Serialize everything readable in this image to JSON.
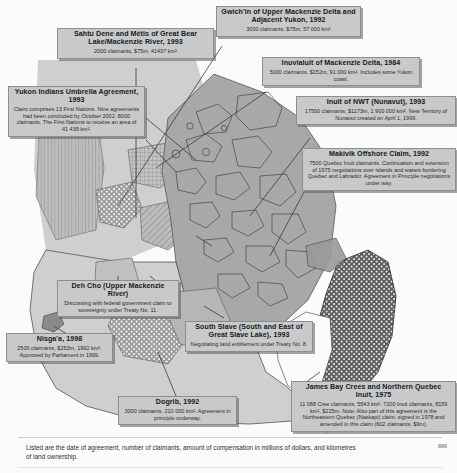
{
  "footnote": "Listed are the date of agreement, number of claimants, amount of compensation in millions of dollars, and kilometres of land ownership.",
  "colors": {
    "land_light": "#cfcfcf",
    "land_mid": "#a8a8a8",
    "land_dark": "#8e8e8e",
    "box_fill": "#c9c9c9",
    "box_border": "#8e8e8e",
    "outline": "#3a3a3a",
    "sea": "#f4f4f4"
  },
  "claims": [
    {
      "id": "sahtu",
      "title": "Sahtu Dene and Métis of Great Bear Lake/Mackenzie River, 1993",
      "detail": "2000 claimants, $75m, 41437 km²"
    },
    {
      "id": "gwichin",
      "title": "Gwich'in of Upper Mackenzie Delta and Adjacent Yukon, 1992",
      "detail": "3000 claimants, $75m, 57 000 km²"
    },
    {
      "id": "inuvialuit",
      "title": "Inuvialuit of Mackenzie Delta, 1984",
      "detail": "5000 claimants, $152m, 91 000 km². Includes some Yukon coast."
    },
    {
      "id": "inuit-nwt",
      "title": "Inuit of NWT (Nunavut), 1993",
      "detail": "17500 claimants, $1173m, 1 900 000 km². New Territory of Nunavut created on April 1, 1999."
    },
    {
      "id": "yukon",
      "title": "Yukon Indians Umbrella Agreement, 1993",
      "detail": "Claim comprises 13 First Nations. Nine agreements had been concluded by October 2002. 8000 claimants. The First Nations to receive an area of 41 439 km²."
    },
    {
      "id": "makivik",
      "title": "Makivik Offshore Claim, 1992",
      "detail": "7500 Quebec Inuit claimants. Continuation and extension of 1975 negotiations over islands and waters bordering Quebec and Labrador. Agreement in Principle negotiations under way."
    },
    {
      "id": "dehcho",
      "title": "Deh Cho (Upper Mackenzie River)",
      "detail": "Discussing with federal government claim to sovereignty under Treaty No. 11."
    },
    {
      "id": "nisgaa",
      "title": "Nisga'a, 1998",
      "detail": "2500 claimants, $253m, 1992 km². Approved by Parliament in 1999."
    },
    {
      "id": "south-slave",
      "title": "South Slave (South and East of Great Slave Lake), 1993",
      "detail": "Negotiating land entitlement under Treaty No. 8."
    },
    {
      "id": "dogrib",
      "title": "Dogrib, 1992",
      "detail": "3000 claimants, 210 000 km². Agreement in principle underway."
    },
    {
      "id": "james-bay",
      "title": "James Bay Crees and Northern Quebec Inuit, 1975",
      "detail": "11 088 Cree claimants, 5543 km². 7200 Inuit claimants, 8159 km², $225m. Note: Also part of this agreement is the Northeastern Quebec (Naskapi) claim, signed in 1978 and amended in this claim (602 claimants, $9m)."
    }
  ]
}
